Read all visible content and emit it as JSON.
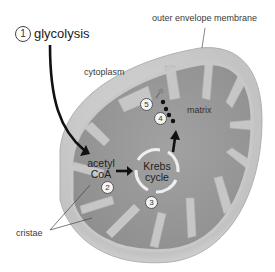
{
  "diagram": {
    "labels": {
      "glycolysis": "glycolysis",
      "outer_envelope_membrane": "outer envelope membrane",
      "cytoplasm": "cytoplasm",
      "matrix": "matrix",
      "acetyl_coa_line1": "acetyl",
      "acetyl_coa_line2": "CoA",
      "krebs_line1": "Krebs",
      "krebs_line2": "cycle",
      "cristae": "cristae"
    },
    "steps": [
      {
        "number": "1",
        "label": "glycolysis"
      },
      {
        "number": "2",
        "label": "acetyl CoA"
      },
      {
        "number": "3",
        "label": "Krebs cycle"
      },
      {
        "number": "4",
        "label": "electron carriers"
      },
      {
        "number": "5",
        "label": "ATP synthase"
      }
    ],
    "colors": {
      "outer_membrane": "#c9c9c9",
      "intermembrane": "#bdbdbd",
      "matrix": "#9a9a9a",
      "cristae": "#c4c4c4",
      "arrow": "#111111",
      "krebs_ring": "#eeeeee"
    }
  }
}
